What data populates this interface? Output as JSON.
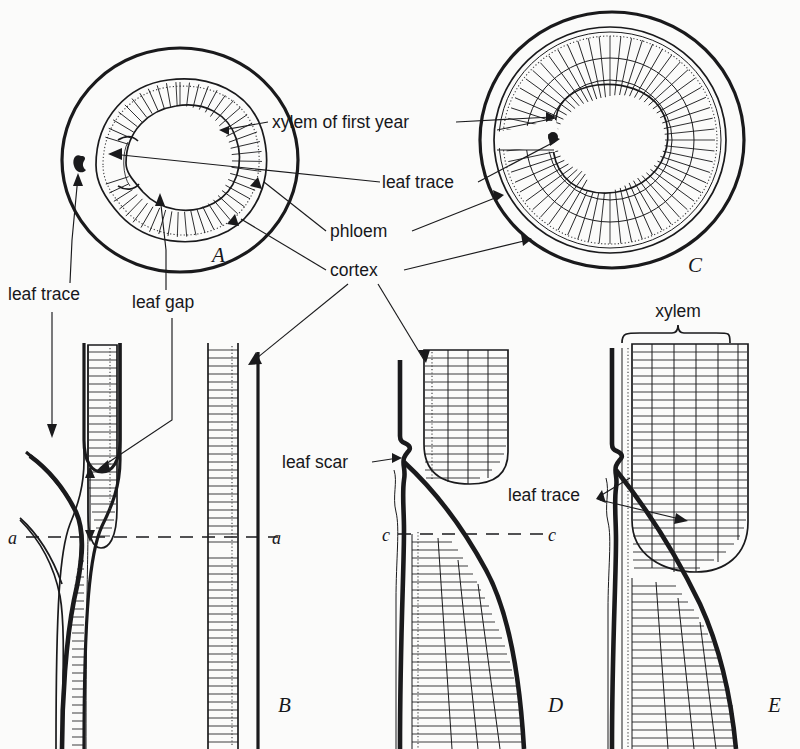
{
  "figure": {
    "background_color": "#fbfbfa",
    "ink_color": "#1a1a1c"
  },
  "labels": {
    "xylem_of_first_year": "xylem of first year",
    "leaf_trace_top": "leaf trace",
    "phloem": "phloem",
    "cortex": "cortex",
    "leaf_trace_left": "leaf trace",
    "leaf_gap": "leaf gap",
    "leaf_scar": "leaf scar",
    "leaf_trace_right": "leaf trace",
    "xylem": "xylem"
  },
  "panels": [
    {
      "id": "A",
      "letter": "A",
      "kind": "cross-section",
      "description": "one-year stem cross section with leaf gap and leaf trace"
    },
    {
      "id": "B",
      "letter": "B",
      "kind": "longitudinal-section",
      "description": "one-year stem longitudinal section"
    },
    {
      "id": "C",
      "letter": "C",
      "kind": "cross-section",
      "description": "three-year stem cross section with three growth rings"
    },
    {
      "id": "D",
      "letter": "D",
      "kind": "longitudinal-section",
      "description": "older stem longitudinal section with leaf scar"
    },
    {
      "id": "E",
      "letter": "E",
      "kind": "longitudinal-section",
      "description": "oldest stem longitudinal section, xylem bracketed"
    }
  ],
  "section_markers": [
    {
      "id": "a-left",
      "text": "a",
      "panel": "B"
    },
    {
      "id": "a-right",
      "text": "a",
      "panel": "B"
    },
    {
      "id": "c-left",
      "text": "c",
      "panel": "D"
    },
    {
      "id": "c-right",
      "text": "c",
      "panel": "D"
    }
  ]
}
